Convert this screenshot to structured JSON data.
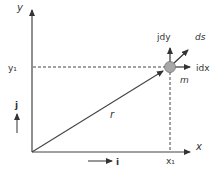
{
  "diagram": {
    "type": "position-vector-diagram",
    "colors": {
      "line": "#444444",
      "dashed": "#444444",
      "mass_fill": "#a8a8a8",
      "mass_stroke": "#777777",
      "text": "#333333"
    },
    "axes": {
      "x_label": "x",
      "y_label": "y"
    },
    "coordinates": {
      "x1_label": "x₁",
      "y1_label": "y₁"
    },
    "vectors": {
      "position_label": "r",
      "ds_label": "ds",
      "idx_label": "idx",
      "jdy_label": "jdy"
    },
    "mass": {
      "label": "m"
    },
    "unit_vectors": {
      "i_label": "i",
      "j_label": "j"
    }
  }
}
